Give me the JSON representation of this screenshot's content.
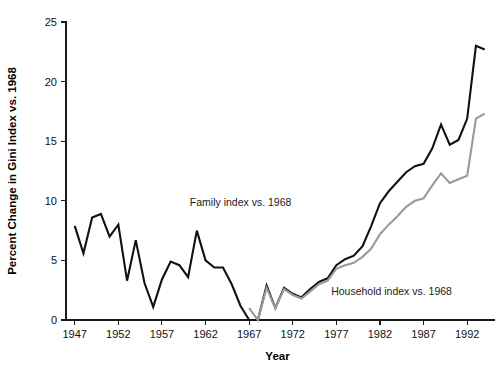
{
  "chart_data": {
    "type": "line",
    "title": "",
    "xlabel": "Year",
    "ylabel": "Percent Change in Gini Index vs. 1968",
    "xlim": [
      1946,
      1994.5
    ],
    "ylim": [
      0,
      25
    ],
    "grid": false,
    "legend_position": "inline-annotations",
    "x_ticks": [
      1947,
      1952,
      1957,
      1962,
      1967,
      1972,
      1977,
      1982,
      1987,
      1992
    ],
    "y_ticks": [
      0,
      5,
      10,
      15,
      20,
      25
    ],
    "series": [
      {
        "name": "Family index vs. 1968",
        "color": "#111111",
        "width": 2.1,
        "annotation": "Family index vs. 1968",
        "annotation_x": 1960.2,
        "annotation_y": 9.6,
        "x": [
          1947,
          1948,
          1949,
          1950,
          1951,
          1952,
          1953,
          1954,
          1955,
          1956,
          1957,
          1958,
          1959,
          1960,
          1961,
          1962,
          1963,
          1964,
          1965,
          1966,
          1967,
          1968,
          1969,
          1970,
          1971,
          1972,
          1973,
          1974,
          1975,
          1976,
          1977,
          1978,
          1979,
          1980,
          1981,
          1982,
          1983,
          1984,
          1985,
          1986,
          1987,
          1988,
          1989,
          1990,
          1991,
          1992,
          1993,
          1994
        ],
        "values": [
          7.9,
          5.6,
          8.6,
          8.9,
          7.0,
          8.0,
          3.3,
          6.7,
          3.1,
          1.1,
          3.4,
          4.9,
          4.6,
          3.6,
          7.5,
          5.0,
          4.4,
          4.4,
          3.0,
          1.2,
          0.0,
          0.0,
          2.9,
          1.0,
          2.7,
          2.2,
          1.9,
          2.6,
          3.2,
          3.5,
          4.6,
          5.1,
          5.4,
          6.2,
          7.9,
          9.8,
          10.8,
          11.6,
          12.4,
          12.9,
          13.1,
          14.4,
          16.4,
          14.7,
          15.1,
          16.9,
          23.0,
          22.7
        ]
      },
      {
        "name": "Household index vs. 1968",
        "color": "#9a9a9a",
        "width": 2.1,
        "annotation": "Household index vs. 1968",
        "annotation_x": 1976.4,
        "annotation_y": 2.1,
        "x": [
          1967,
          1968,
          1969,
          1970,
          1971,
          1972,
          1973,
          1974,
          1975,
          1976,
          1977,
          1978,
          1979,
          1980,
          1981,
          1982,
          1983,
          1984,
          1985,
          1986,
          1987,
          1988,
          1989,
          1990,
          1991,
          1992,
          1993,
          1994
        ],
        "values": [
          1.0,
          0.0,
          2.7,
          1.0,
          2.6,
          2.1,
          1.8,
          2.4,
          3.0,
          3.3,
          4.3,
          4.6,
          4.8,
          5.3,
          6.0,
          7.2,
          8.0,
          8.7,
          9.5,
          10.0,
          10.2,
          11.3,
          12.3,
          11.5,
          11.8,
          12.1,
          16.9,
          17.3
        ]
      }
    ]
  }
}
